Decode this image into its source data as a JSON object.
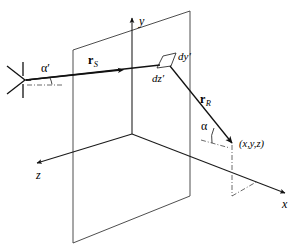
{
  "figure": {
    "background_color": "#ffffff",
    "line_color": "#1a1a1a",
    "axes": [
      {
        "name": "y-axis",
        "label": "y",
        "direction": "up"
      },
      {
        "name": "x-axis",
        "label": "x",
        "direction": "down-right"
      },
      {
        "name": "z-axis",
        "label": "z",
        "direction": "down-left"
      }
    ],
    "axis_labels": {
      "x": "x",
      "y": "y",
      "z": "z"
    },
    "vectors": [
      {
        "name": "incident-vector",
        "symbol": "r",
        "subscript": "S",
        "description": "source-to-surface incidence vector"
      },
      {
        "name": "scattered-vector",
        "symbol": "r",
        "subscript": "R",
        "description": "surface-to-receiver scattering vector"
      }
    ],
    "angles": [
      {
        "name": "incidence-angle",
        "label": "α′"
      },
      {
        "name": "scattering-angle",
        "label": "α"
      }
    ],
    "differential_patch": {
      "name": "differential-surface-element",
      "height_label": "dy′",
      "width_label": "dz′"
    },
    "field_point": {
      "name": "observation-point",
      "label": "(x,y,z)"
    },
    "source": {
      "name": "source-antenna",
      "icon": "horn-antenna-icon"
    },
    "plane": {
      "name": "scattering-plane",
      "description": "vertical rough-surface plane containing the differential element"
    }
  }
}
